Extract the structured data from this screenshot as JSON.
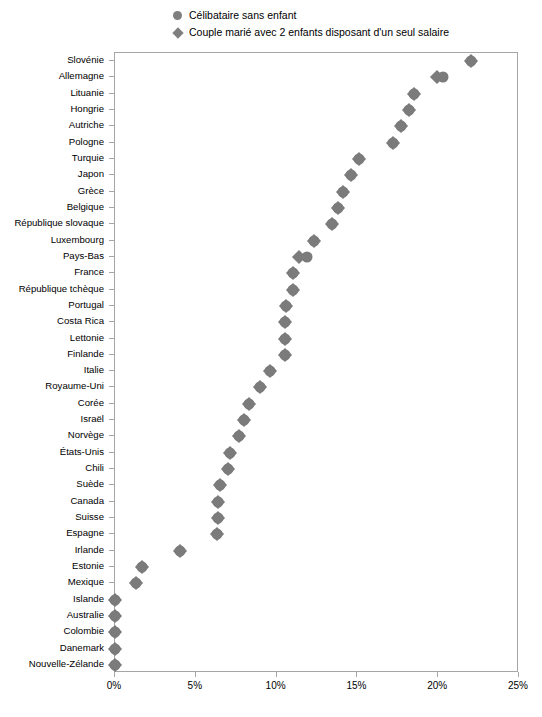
{
  "legend": {
    "position": "top-center",
    "items": [
      {
        "marker": "circle",
        "icon": "circle-marker-icon",
        "label": "Célibataire sans enfant"
      },
      {
        "marker": "diamond",
        "icon": "diamond-marker-icon",
        "label": "Couple marié avec 2 enfants disposant d'un seul salaire"
      }
    ]
  },
  "colors": {
    "marker": "#7b7b7b",
    "axis": "#a6a6a6",
    "background": "#ffffff",
    "text": "#000000"
  },
  "chart_data": {
    "type": "scatter",
    "title": "",
    "subtitle": "",
    "xlabel": "",
    "ylabel": "",
    "xlim": [
      0,
      25
    ],
    "xticks": [
      0,
      5,
      10,
      15,
      20,
      25
    ],
    "xticklabels": [
      "0%",
      "5%",
      "10%",
      "15%",
      "20%",
      "25%"
    ],
    "grid": false,
    "orientation": "horizontal",
    "categories": [
      "Slovénie",
      "Allemagne",
      "Lituanie",
      "Hongrie",
      "Autriche",
      "Pologne",
      "Turquie",
      "Japon",
      "Grèce",
      "Belgique",
      "République slovaque",
      "Luxembourg",
      "Pays-Bas",
      "France",
      "République tchèque",
      "Portugal",
      "Costa Rica",
      "Lettonie",
      "Finlande",
      "Italie",
      "Royaume-Uni",
      "Corée",
      "Israël",
      "Norvège",
      "États-Unis",
      "Chili",
      "Suède",
      "Canada",
      "Suisse",
      "Espagne",
      "Irlande",
      "Estonie",
      "Mexique",
      "Islande",
      "Australie",
      "Colombie",
      "Danemark",
      "Nouvelle-Zélande"
    ],
    "series": [
      {
        "name": "Célibataire sans enfant",
        "marker": "circle",
        "values": [
          22.0,
          20.3,
          18.5,
          18.2,
          17.7,
          17.2,
          15.1,
          14.6,
          14.1,
          13.8,
          13.4,
          12.3,
          11.9,
          11.0,
          11.0,
          10.6,
          10.5,
          10.5,
          10.5,
          9.6,
          9.0,
          8.3,
          8.0,
          7.7,
          7.1,
          7.0,
          6.5,
          6.4,
          6.4,
          6.3,
          4.0,
          1.7,
          1.3,
          0.0,
          0.0,
          0.0,
          0.0,
          0.0
        ]
      },
      {
        "name": "Couple marié avec 2 enfants disposant d'un seul salaire",
        "marker": "diamond",
        "values": [
          22.0,
          19.9,
          18.5,
          18.2,
          17.7,
          17.2,
          15.1,
          14.6,
          14.1,
          13.8,
          13.4,
          12.3,
          11.4,
          11.0,
          11.0,
          10.6,
          10.5,
          10.5,
          10.5,
          9.6,
          9.0,
          8.3,
          8.0,
          7.7,
          7.1,
          7.0,
          6.5,
          6.4,
          6.4,
          6.3,
          4.0,
          1.7,
          1.3,
          0.0,
          0.0,
          0.0,
          0.0,
          0.0
        ]
      }
    ]
  }
}
